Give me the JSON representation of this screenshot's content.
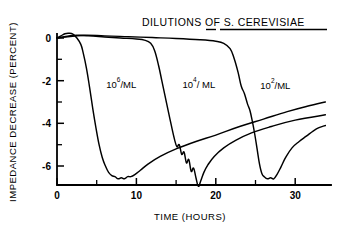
{
  "chart_data": {
    "type": "line",
    "title": "DILUTIONS OF S. CEREVISIAE",
    "title_parts": {
      "prefix": "DILUTIONS OF ",
      "underlined_genus": "S.",
      "underlined_species": "CEREVISIAE"
    },
    "xlabel": "TIME (HOURS)",
    "ylabel": "IMPEDANCE DECREASE (PERCENT)",
    "xlim": [
      0,
      34
    ],
    "ylim": [
      -7.4,
      0.6
    ],
    "grid": false,
    "legend_position": "inline-annotations",
    "xticks": [
      0,
      10,
      20,
      30
    ],
    "xtick_labels": [
      "0",
      "10",
      "20",
      "30"
    ],
    "xticks_minor": [
      5,
      15,
      25
    ],
    "yticks": [
      0,
      -2,
      -4,
      -6
    ],
    "ytick_labels": [
      "0",
      "-2",
      "-4",
      "-6"
    ],
    "yticks_minor": [
      -1,
      -3,
      -5
    ],
    "series": [
      {
        "name": "10^6/ML",
        "label": "10",
        "label_exponent": "6",
        "label_suffix": "/ML",
        "label_x": 6.2,
        "label_y": -2.35,
        "onset_hours": 3.0,
        "minimum_percent": -6.6,
        "minimum_hours": 8.0,
        "end_percent": -3.0,
        "x": [
          0,
          0.5,
          1.0,
          1.5,
          2.0,
          2.5,
          3.0,
          3.3,
          3.7,
          4.1,
          4.5,
          4.9,
          5.3,
          5.7,
          6.1,
          6.5,
          6.9,
          7.3,
          7.7,
          8.1,
          8.5,
          8.9,
          9.3,
          9.8,
          10.5,
          11.5,
          13.0,
          15.0,
          17.5,
          20.0,
          23.0,
          26.0,
          29.0,
          31.5,
          33.8
        ],
        "y": [
          0.0,
          0.1,
          0.2,
          0.22,
          0.18,
          0.0,
          -0.3,
          -0.7,
          -1.4,
          -2.3,
          -3.3,
          -4.2,
          -5.0,
          -5.6,
          -6.0,
          -6.3,
          -6.45,
          -6.5,
          -6.6,
          -6.55,
          -6.6,
          -6.5,
          -6.5,
          -6.4,
          -6.2,
          -5.9,
          -5.55,
          -5.2,
          -4.85,
          -4.55,
          -4.15,
          -3.8,
          -3.45,
          -3.2,
          -3.0
        ]
      },
      {
        "name": "10^4/ML",
        "label": "10",
        "label_exponent": "4",
        "label_suffix": "/ ML",
        "label_x": 15.8,
        "label_y": -2.35,
        "onset_hours": 12.0,
        "minimum_percent": -7.0,
        "minimum_hours": 17.8,
        "end_percent": -3.6,
        "x": [
          0,
          2.0,
          4.0,
          6.0,
          8.0,
          10.0,
          11.0,
          11.8,
          12.3,
          12.8,
          13.2,
          13.6,
          14.0,
          14.4,
          14.8,
          15.1,
          15.4,
          15.7,
          16.0,
          16.3,
          16.6,
          16.9,
          17.2,
          17.5,
          17.8,
          18.1,
          18.5,
          19.0,
          19.8,
          21.0,
          22.5,
          24.5,
          27.0,
          30.0,
          33.8
        ],
        "y": [
          0.0,
          0.12,
          0.1,
          0.05,
          0.0,
          -0.05,
          -0.1,
          -0.25,
          -0.6,
          -1.3,
          -2.0,
          -2.7,
          -3.4,
          -4.1,
          -4.75,
          -5.1,
          -5.0,
          -5.45,
          -5.35,
          -5.85,
          -5.7,
          -6.25,
          -6.1,
          -6.55,
          -6.95,
          -6.7,
          -6.3,
          -5.95,
          -5.55,
          -5.15,
          -4.8,
          -4.45,
          -4.15,
          -3.85,
          -3.6
        ]
      },
      {
        "name": "10^2/ML",
        "label": "10",
        "label_exponent": "2",
        "label_suffix": "/ML",
        "label_x": 25.6,
        "label_y": -2.4,
        "onset_hours": 22.0,
        "minimum_percent": -6.6,
        "minimum_hours": 26.6,
        "end_percent": -4.1,
        "x": [
          0,
          3.0,
          6.0,
          9.0,
          12.0,
          15.0,
          18.0,
          20.0,
          21.0,
          21.8,
          22.3,
          22.8,
          23.2,
          23.6,
          24.0,
          24.3,
          24.6,
          24.9,
          25.2,
          25.5,
          25.8,
          26.1,
          26.5,
          26.9,
          27.3,
          27.7,
          28.2,
          28.8,
          29.6,
          30.5,
          31.4,
          32.3,
          33.0,
          33.8
        ],
        "y": [
          0.0,
          0.12,
          0.1,
          0.06,
          0.02,
          -0.02,
          -0.08,
          -0.15,
          -0.25,
          -0.5,
          -0.95,
          -1.6,
          -2.25,
          -2.6,
          -3.1,
          -3.4,
          -3.9,
          -4.5,
          -5.2,
          -5.9,
          -6.35,
          -6.5,
          -6.6,
          -6.55,
          -6.6,
          -6.4,
          -6.05,
          -5.6,
          -5.15,
          -4.85,
          -4.6,
          -4.35,
          -4.2,
          -4.1
        ]
      }
    ]
  }
}
